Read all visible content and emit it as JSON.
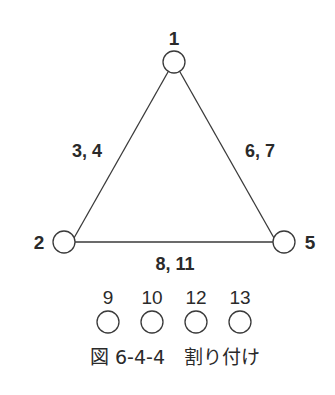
{
  "diagram": {
    "nodes": [
      {
        "id": "1",
        "label": "1"
      },
      {
        "id": "2",
        "label": "2"
      },
      {
        "id": "5",
        "label": "5"
      }
    ],
    "edges": [
      {
        "from": "1",
        "to": "2",
        "label": "3, 4"
      },
      {
        "from": "1",
        "to": "5",
        "label": "6, 7"
      },
      {
        "from": "2",
        "to": "5",
        "label": "8, 11"
      }
    ],
    "unassigned_nodes": [
      {
        "label": "9"
      },
      {
        "label": "10"
      },
      {
        "label": "12"
      },
      {
        "label": "13"
      }
    ],
    "caption": "図 6-4-4　割り付け"
  },
  "colors": {
    "stroke": "#3a3a3a",
    "text": "#2a2a2a",
    "background": "#ffffff"
  }
}
